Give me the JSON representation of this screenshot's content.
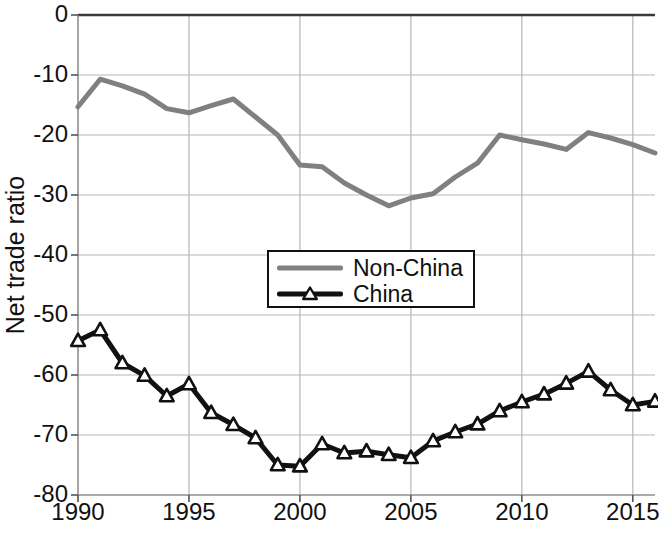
{
  "chart_data": {
    "type": "line",
    "title": "",
    "xlabel": "",
    "ylabel": "Net trade ratio",
    "xlim": [
      1990,
      2016
    ],
    "ylim": [
      -80,
      0
    ],
    "ytick_labels": [
      "0",
      "-10",
      "-20",
      "-30",
      "-40",
      "-50",
      "-60",
      "-70",
      "-80"
    ],
    "ytick_values": [
      0,
      -10,
      -20,
      -30,
      -40,
      -50,
      -60,
      -70,
      -80
    ],
    "xtick_labels": [
      "1990",
      "1995",
      "2000",
      "2005",
      "2010",
      "2015"
    ],
    "xtick_values": [
      1990,
      1995,
      2000,
      2005,
      2010,
      2015
    ],
    "grid": true,
    "legend_position": "center",
    "x": [
      1990,
      1991,
      1992,
      1993,
      1994,
      1995,
      1996,
      1997,
      1998,
      1999,
      2000,
      2001,
      2002,
      2003,
      2004,
      2005,
      2006,
      2007,
      2008,
      2009,
      2010,
      2011,
      2012,
      2013,
      2014,
      2015,
      2016
    ],
    "series": [
      {
        "name": "Non-China",
        "color": "#808080",
        "marker": "none",
        "line_width": 5,
        "values": [
          -15.3,
          -10.7,
          -11.8,
          -13.2,
          -15.6,
          -16.3,
          -15.1,
          -14.0,
          -17.0,
          -20.0,
          -25.0,
          -25.3,
          -28.0,
          -30.0,
          -31.8,
          -30.5,
          -29.8,
          -27.0,
          -24.7,
          -20.0,
          -20.8,
          -21.5,
          -22.4,
          -19.6,
          -20.5,
          -21.6,
          -23.0
        ]
      },
      {
        "name": "China",
        "color": "#111111",
        "marker": "triangle",
        "line_width": 5,
        "values": [
          -54.3,
          -52.5,
          -58.0,
          -60.1,
          -63.5,
          -61.5,
          -66.3,
          -68.3,
          -70.5,
          -75.0,
          -75.2,
          -71.5,
          -73.0,
          -72.7,
          -73.3,
          -73.8,
          -71.0,
          -69.5,
          -68.2,
          -66.0,
          -64.5,
          -63.2,
          -61.4,
          -59.4,
          -62.5,
          -65.0,
          -64.4
        ]
      }
    ]
  },
  "legend": {
    "entries": [
      {
        "label": "Non-China"
      },
      {
        "label": "China"
      }
    ]
  },
  "axes": {
    "y_axis_title": "Net trade ratio"
  }
}
